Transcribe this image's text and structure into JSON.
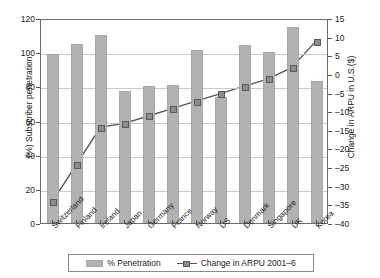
{
  "chart_data": {
    "type": "bar",
    "title": "",
    "subtitle": "",
    "categories": [
      "Switzerland",
      "Finland",
      "Ireland",
      "Japan",
      "Germany",
      "France",
      "Norway",
      "US",
      "Denmark",
      "Singapore",
      "UK",
      "Korea"
    ],
    "series": [
      {
        "name": "% Penetration",
        "kind": "bar",
        "axis": "left",
        "color": "#b2b2b2",
        "values": [
          99,
          105,
          110,
          77,
          80,
          81,
          101,
          74,
          104,
          100,
          115,
          83
        ]
      },
      {
        "name": "Change in ARPU 2001–6",
        "kind": "line",
        "axis": "right",
        "color": "#8c8c8c",
        "values": [
          -34,
          -24,
          -14,
          -13,
          -11,
          -9,
          -7,
          -5,
          -3,
          -1,
          2,
          9
        ]
      }
    ],
    "xlabel": "",
    "ylabel": "(%) Subscriber penetration",
    "y2label": "Change in ARPU in U.S.($)",
    "ylim": [
      0,
      120
    ],
    "yticks": [
      0,
      20,
      40,
      60,
      80,
      100,
      120
    ],
    "y2lim": [
      -40,
      15
    ],
    "y2ticks": [
      15,
      10,
      5,
      0,
      -5,
      -10,
      -15,
      -20,
      -25,
      -30,
      -35,
      -40
    ],
    "grid": true,
    "legend_position": "bottom",
    "legend": [
      "% Penetration",
      "Change in ARPU 2001–6"
    ]
  }
}
